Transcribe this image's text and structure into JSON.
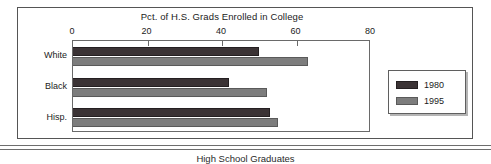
{
  "chart_data": {
    "type": "bar",
    "orientation": "horizontal",
    "title": "Pct. of H.S. Grads Enrolled in College",
    "xlabel": "",
    "ylabel": "",
    "categories": [
      "White",
      "Black",
      "Hisp."
    ],
    "series": [
      {
        "name": "1980",
        "values": [
          50,
          42,
          53
        ],
        "color": "#3b3335"
      },
      {
        "name": "1995",
        "values": [
          63,
          52,
          55
        ],
        "color": "#7d7d7d"
      }
    ],
    "xlim": [
      0,
      80
    ],
    "xticks": [
      0,
      20,
      40,
      60,
      80
    ],
    "xtick_labels": [
      "0",
      "20",
      "40",
      "60",
      "80"
    ],
    "grid": false,
    "legend_position": "right-outside",
    "legend_entries": [
      "1980",
      "1995"
    ]
  },
  "footer": {
    "caption": "High School Graduates"
  },
  "colors": {
    "series_1980": "#3b3335",
    "series_1995": "#7d7d7d",
    "frame": "#555555",
    "axis": "#6a6a6a",
    "text": "#1b1b1b"
  }
}
